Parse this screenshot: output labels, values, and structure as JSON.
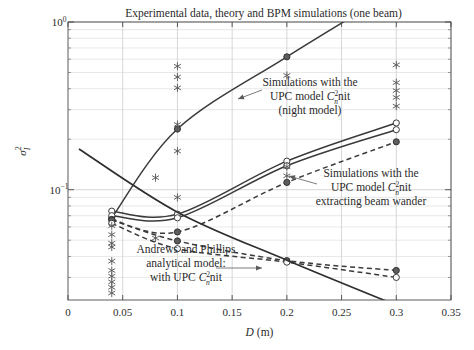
{
  "figure": {
    "width": 474,
    "height": 350,
    "background": "#ffffff"
  },
  "chart_data": {
    "type": "line",
    "title": "Experimental data, theory and BPM simulations (one beam)",
    "xlabel": "D (m)",
    "xlabel_symbol": "D",
    "xlabel_unit": "(m)",
    "ylabel": "σ²ᵢ",
    "ylabel_base": "σ",
    "ylabel_sup": "2",
    "ylabel_sub": "I",
    "xscale": "linear",
    "yscale": "log",
    "xlim": [
      0,
      0.35
    ],
    "ylim": [
      0.022,
      1.0
    ],
    "xticks": [
      0,
      0.05,
      0.1,
      0.15,
      0.2,
      0.25,
      0.3,
      0.35
    ],
    "xticklabels": [
      "0",
      "0.05",
      "0.1",
      "0.15",
      "0.2",
      "0.25",
      "0.3",
      "0.35"
    ],
    "yticks": [
      1.0,
      0.1
    ],
    "yticklabels": [
      "10⁰",
      "10⁻¹"
    ],
    "yticklabel_mantissa": [
      "10",
      "10"
    ],
    "yticklabel_exponent": [
      "0",
      "−1"
    ],
    "grid": true,
    "legend_position": "none-inline-annotations",
    "accent_color": "#3a3a3a",
    "grid_color": "#d9d9d9",
    "series": [
      {
        "name": "Simulations with the UPC model Cn2 nit (night model)",
        "style": "solid",
        "marker": "circle-filled",
        "x": [
          0.04,
          0.1,
          0.2,
          0.3
        ],
        "y": [
          0.068,
          0.23,
          0.62,
          1.55
        ]
      },
      {
        "name": "BPM simulation upper branch (beam wander extracted) A",
        "style": "solid",
        "marker": "circle-open",
        "x": [
          0.04,
          0.1,
          0.2,
          0.3
        ],
        "y": [
          0.0745,
          0.0715,
          0.148,
          0.25
        ]
      },
      {
        "name": "BPM simulation upper branch (beam wander extracted) B",
        "style": "solid",
        "marker": "circle-open",
        "x": [
          0.04,
          0.1,
          0.2,
          0.3
        ],
        "y": [
          0.07,
          0.068,
          0.139,
          0.228
        ]
      },
      {
        "name": "Simulations with the UPC model Cn2 nit extracting beam wander",
        "style": "dashed",
        "marker": "circle-filled",
        "x": [
          0.04,
          0.1,
          0.2,
          0.3
        ],
        "y": [
          0.0665,
          0.056,
          0.1105,
          0.193
        ]
      },
      {
        "name": "BPM dashed lower branch A",
        "style": "dashed",
        "marker": "circle-filled",
        "x": [
          0.04,
          0.1,
          0.2,
          0.3
        ],
        "y": [
          0.066,
          0.0495,
          0.0378,
          0.033
        ]
      },
      {
        "name": "BPM dashed lower branch B",
        "style": "dashed",
        "marker": "circle-open",
        "x": [
          0.04,
          0.1,
          0.2,
          0.3
        ],
        "y": [
          0.063,
          0.0445,
          0.037,
          0.03
        ]
      },
      {
        "name": "Andrews and Phillips analytical model: with UPC Cn2 nit",
        "style": "solid",
        "marker": "none",
        "x": [
          0.01,
          0.1,
          0.2,
          0.3
        ],
        "y": [
          0.175,
          0.0735,
          0.038,
          0.0205
        ]
      }
    ],
    "experimental_points": {
      "name": "Experimental data",
      "marker": "asterisk",
      "color": "#5a5a5a",
      "points": [
        {
          "x": 0.04,
          "y": 0.061
        },
        {
          "x": 0.04,
          "y": 0.054
        },
        {
          "x": 0.04,
          "y": 0.048
        },
        {
          "x": 0.04,
          "y": 0.0455
        },
        {
          "x": 0.04,
          "y": 0.0375
        },
        {
          "x": 0.04,
          "y": 0.033
        },
        {
          "x": 0.04,
          "y": 0.0305
        },
        {
          "x": 0.04,
          "y": 0.0282
        },
        {
          "x": 0.04,
          "y": 0.0262
        },
        {
          "x": 0.04,
          "y": 0.0242
        },
        {
          "x": 0.08,
          "y": 0.118
        },
        {
          "x": 0.08,
          "y": 0.0515
        },
        {
          "x": 0.1,
          "y": 0.545
        },
        {
          "x": 0.1,
          "y": 0.47
        },
        {
          "x": 0.1,
          "y": 0.405
        },
        {
          "x": 0.1,
          "y": 0.245
        },
        {
          "x": 0.1,
          "y": 0.17
        },
        {
          "x": 0.1,
          "y": 0.09
        },
        {
          "x": 0.2,
          "y": 0.48
        },
        {
          "x": 0.2,
          "y": 0.137
        },
        {
          "x": 0.2,
          "y": 0.121
        },
        {
          "x": 0.3,
          "y": 0.555
        },
        {
          "x": 0.3,
          "y": 0.435
        },
        {
          "x": 0.3,
          "y": 0.39
        },
        {
          "x": 0.3,
          "y": 0.355
        },
        {
          "x": 0.3,
          "y": 0.315
        }
      ]
    },
    "annotations": [
      {
        "id": "annot-night-model",
        "lines": [
          "Simulations with the",
          "UPC model C²ₙnit",
          "(night model)"
        ],
        "line_parts": [
          {
            "text": "Simulations with the"
          },
          {
            "pre": "UPC model ",
            "sym": "C",
            "sup": "2",
            "sub": "n",
            "post": "nit"
          },
          {
            "text": "(night model)"
          }
        ],
        "text_x": 310,
        "text_y": 86,
        "leader_from": [
          262,
          90
        ],
        "leader_to": [
          238,
          99
        ]
      },
      {
        "id": "annot-beam-wander",
        "lines": [
          "Simulations with the",
          "UPC model C²ₙnit",
          "extracting beam wander"
        ],
        "line_parts": [
          {
            "text": "Simulations with the"
          },
          {
            "pre": "UPC model ",
            "sym": "C",
            "sup": "2",
            "sub": "n",
            "post": "nit"
          },
          {
            "text": "extracting beam wander"
          }
        ],
        "text_x": 371,
        "text_y": 177,
        "leader_from": [
          317,
          184
        ],
        "leader_to": [
          289,
          176
        ]
      },
      {
        "id": "annot-andrews-phillips",
        "lines": [
          "Andrews and Phillips",
          "analytical model:",
          "with UPC C²ₙnit"
        ],
        "line_parts": [
          {
            "text": "Andrews and Phillips"
          },
          {
            "text": "analytical model:"
          },
          {
            "pre": "with UPC ",
            "sym": "C",
            "sup": "2",
            "sub": "n",
            "post": "nit"
          }
        ],
        "text_x": 186,
        "text_y": 253,
        "leader_from": [
          216,
          268
        ],
        "leader_to": [
          262,
          268
        ]
      }
    ]
  }
}
